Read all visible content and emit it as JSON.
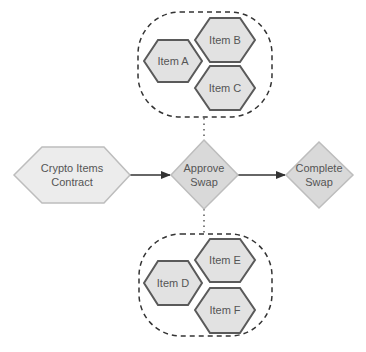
{
  "diagram": {
    "colors": {
      "item_fill": "#e2e2e2",
      "item_stroke": "#5a5a5a",
      "contract_fill": "#ececec",
      "contract_stroke": "#bdbdbd",
      "diamond_fill": "#d9d9d9",
      "diamond_stroke": "#bdbdbd",
      "edge": "#333333",
      "dashed": "#333333",
      "text": "#555555"
    },
    "nodes": {
      "contract": {
        "line1": "Crypto Items",
        "line2": "Contract"
      },
      "approve": {
        "line1": "Approve",
        "line2": "Swap"
      },
      "complete": {
        "line1": "Complete",
        "line2": "Swap"
      }
    },
    "groups": {
      "top": {
        "items": [
          {
            "label": "Item A"
          },
          {
            "label": "Item B"
          },
          {
            "label": "Item C"
          }
        ]
      },
      "bottom": {
        "items": [
          {
            "label": "Item D"
          },
          {
            "label": "Item E"
          },
          {
            "label": "Item F"
          }
        ]
      }
    },
    "edges": [
      {
        "from": "contract",
        "to": "approve",
        "style": "solid-arrow"
      },
      {
        "from": "approve",
        "to": "complete",
        "style": "solid-arrow"
      },
      {
        "from": "approve",
        "to": "top-group",
        "style": "dotted"
      },
      {
        "from": "approve",
        "to": "bottom-group",
        "style": "dotted"
      }
    ]
  }
}
